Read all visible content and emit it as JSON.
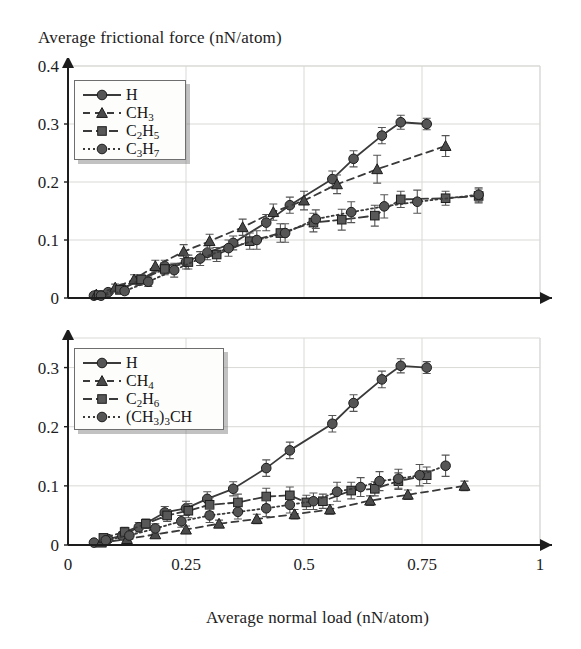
{
  "figure": {
    "y_axis_title": "Average frictional force (nN/atom)",
    "x_axis_title": "Average normal load (nN/atom)"
  },
  "chart_data": [
    {
      "id": "top",
      "type": "line",
      "title": "",
      "xlabel": "Average normal load (nN/atom)",
      "ylabel": "Average frictional force (nN/atom)",
      "xlim": [
        0,
        1
      ],
      "ylim": [
        0,
        0.4
      ],
      "xticks": [
        0,
        0.25,
        0.5,
        0.75,
        1
      ],
      "xticklabels": [
        "0",
        "0.25",
        "0.5",
        "0.75",
        "1"
      ],
      "yticks": [
        0,
        0.1,
        0.2,
        0.3,
        0.4
      ],
      "yticklabels": [
        "0",
        "0.1",
        "0.2",
        "0.3",
        "0.4"
      ],
      "grid": true,
      "legend_position": "upper-left",
      "series": [
        {
          "name": "H",
          "marker": "circle",
          "linestyle": "solid",
          "color": "#3a3a3a",
          "points": [
            {
              "x": 0.055,
              "y": 0.004,
              "err": 0.004
            },
            {
              "x": 0.085,
              "y": 0.01,
              "err": 0.005
            },
            {
              "x": 0.115,
              "y": 0.016,
              "err": 0.006
            },
            {
              "x": 0.15,
              "y": 0.03,
              "err": 0.008
            },
            {
              "x": 0.205,
              "y": 0.055,
              "err": 0.01
            },
            {
              "x": 0.25,
              "y": 0.062,
              "err": 0.012
            },
            {
              "x": 0.295,
              "y": 0.078,
              "err": 0.012
            },
            {
              "x": 0.35,
              "y": 0.095,
              "err": 0.012
            },
            {
              "x": 0.42,
              "y": 0.13,
              "err": 0.014
            },
            {
              "x": 0.47,
              "y": 0.16,
              "err": 0.014
            },
            {
              "x": 0.56,
              "y": 0.205,
              "err": 0.014
            },
            {
              "x": 0.605,
              "y": 0.24,
              "err": 0.014
            },
            {
              "x": 0.665,
              "y": 0.28,
              "err": 0.014
            },
            {
              "x": 0.705,
              "y": 0.303,
              "err": 0.012
            },
            {
              "x": 0.76,
              "y": 0.3,
              "err": 0.01
            }
          ]
        },
        {
          "name": "CH3",
          "name_html": "CH<sub>3</sub>",
          "marker": "triangle",
          "linestyle": "dashed",
          "color": "#3a3a3a",
          "points": [
            {
              "x": 0.06,
              "y": 0.006,
              "err": 0.004
            },
            {
              "x": 0.1,
              "y": 0.018,
              "err": 0.006
            },
            {
              "x": 0.14,
              "y": 0.032,
              "err": 0.008
            },
            {
              "x": 0.185,
              "y": 0.055,
              "err": 0.01
            },
            {
              "x": 0.245,
              "y": 0.08,
              "err": 0.012
            },
            {
              "x": 0.3,
              "y": 0.098,
              "err": 0.012
            },
            {
              "x": 0.37,
              "y": 0.122,
              "err": 0.014
            },
            {
              "x": 0.435,
              "y": 0.148,
              "err": 0.014
            },
            {
              "x": 0.5,
              "y": 0.168,
              "err": 0.016
            },
            {
              "x": 0.57,
              "y": 0.196,
              "err": 0.016
            },
            {
              "x": 0.655,
              "y": 0.222,
              "err": 0.024
            },
            {
              "x": 0.8,
              "y": 0.262,
              "err": 0.018
            }
          ]
        },
        {
          "name": "C2H5",
          "name_html": "C<sub>2</sub>H<sub>5</sub>",
          "marker": "square",
          "linestyle": "dashdot",
          "color": "#3a3a3a",
          "points": [
            {
              "x": 0.065,
              "y": 0.005,
              "err": 0.004
            },
            {
              "x": 0.11,
              "y": 0.014,
              "err": 0.006
            },
            {
              "x": 0.155,
              "y": 0.032,
              "err": 0.008
            },
            {
              "x": 0.205,
              "y": 0.05,
              "err": 0.01
            },
            {
              "x": 0.255,
              "y": 0.062,
              "err": 0.012
            },
            {
              "x": 0.315,
              "y": 0.075,
              "err": 0.012
            },
            {
              "x": 0.385,
              "y": 0.098,
              "err": 0.014
            },
            {
              "x": 0.45,
              "y": 0.112,
              "err": 0.016
            },
            {
              "x": 0.52,
              "y": 0.13,
              "err": 0.016
            },
            {
              "x": 0.58,
              "y": 0.135,
              "err": 0.018
            },
            {
              "x": 0.65,
              "y": 0.142,
              "err": 0.018
            },
            {
              "x": 0.705,
              "y": 0.17,
              "err": 0.014
            },
            {
              "x": 0.8,
              "y": 0.172,
              "err": 0.012
            },
            {
              "x": 0.87,
              "y": 0.176,
              "err": 0.012
            }
          ]
        },
        {
          "name": "C3H7",
          "name_html": "C<sub>3</sub>H<sub>7</sub>",
          "marker": "circle",
          "linestyle": "dotted",
          "color": "#3a3a3a",
          "points": [
            {
              "x": 0.07,
              "y": 0.004,
              "err": 0.004
            },
            {
              "x": 0.12,
              "y": 0.012,
              "err": 0.006
            },
            {
              "x": 0.17,
              "y": 0.028,
              "err": 0.008
            },
            {
              "x": 0.225,
              "y": 0.048,
              "err": 0.012
            },
            {
              "x": 0.28,
              "y": 0.068,
              "err": 0.012
            },
            {
              "x": 0.34,
              "y": 0.086,
              "err": 0.014
            },
            {
              "x": 0.4,
              "y": 0.1,
              "err": 0.016
            },
            {
              "x": 0.46,
              "y": 0.112,
              "err": 0.016
            },
            {
              "x": 0.525,
              "y": 0.136,
              "err": 0.016
            },
            {
              "x": 0.6,
              "y": 0.148,
              "err": 0.018
            },
            {
              "x": 0.67,
              "y": 0.158,
              "err": 0.02
            },
            {
              "x": 0.74,
              "y": 0.166,
              "err": 0.02
            },
            {
              "x": 0.87,
              "y": 0.178,
              "err": 0.012
            }
          ]
        }
      ]
    },
    {
      "id": "bottom",
      "type": "line",
      "title": "",
      "xlabel": "Average normal load (nN/atom)",
      "ylabel": "Average frictional force (nN/atom)",
      "xlim": [
        0,
        1
      ],
      "ylim": [
        0,
        0.35
      ],
      "xticks": [
        0,
        0.25,
        0.5,
        0.75,
        1
      ],
      "xticklabels": [
        "0",
        "0.25",
        "0.5",
        "0.75",
        "1"
      ],
      "yticks": [
        0,
        0.1,
        0.2,
        0.3
      ],
      "yticklabels": [
        "0",
        "0.1",
        "0.2",
        "0.3"
      ],
      "grid": true,
      "legend_position": "upper-left",
      "series": [
        {
          "name": "H",
          "marker": "circle",
          "linestyle": "solid",
          "color": "#3a3a3a",
          "points": [
            {
              "x": 0.055,
              "y": 0.004,
              "err": 0.004
            },
            {
              "x": 0.085,
              "y": 0.01,
              "err": 0.005
            },
            {
              "x": 0.115,
              "y": 0.016,
              "err": 0.006
            },
            {
              "x": 0.15,
              "y": 0.03,
              "err": 0.008
            },
            {
              "x": 0.205,
              "y": 0.055,
              "err": 0.01
            },
            {
              "x": 0.25,
              "y": 0.062,
              "err": 0.012
            },
            {
              "x": 0.295,
              "y": 0.078,
              "err": 0.012
            },
            {
              "x": 0.35,
              "y": 0.095,
              "err": 0.012
            },
            {
              "x": 0.42,
              "y": 0.13,
              "err": 0.014
            },
            {
              "x": 0.47,
              "y": 0.16,
              "err": 0.014
            },
            {
              "x": 0.56,
              "y": 0.205,
              "err": 0.014
            },
            {
              "x": 0.605,
              "y": 0.24,
              "err": 0.014
            },
            {
              "x": 0.665,
              "y": 0.28,
              "err": 0.014
            },
            {
              "x": 0.705,
              "y": 0.303,
              "err": 0.012
            },
            {
              "x": 0.76,
              "y": 0.3,
              "err": 0.01
            }
          ]
        },
        {
          "name": "CH4",
          "name_html": "CH<sub>4</sub>",
          "marker": "triangle",
          "linestyle": "dashed",
          "color": "#3a3a3a",
          "points": [
            {
              "x": 0.07,
              "y": 0.004,
              "err": 0.004
            },
            {
              "x": 0.125,
              "y": 0.01,
              "err": 0.005
            },
            {
              "x": 0.185,
              "y": 0.018,
              "err": 0.006
            },
            {
              "x": 0.25,
              "y": 0.026,
              "err": 0.006
            },
            {
              "x": 0.32,
              "y": 0.036,
              "err": 0.006
            },
            {
              "x": 0.4,
              "y": 0.044,
              "err": 0.008
            },
            {
              "x": 0.48,
              "y": 0.052,
              "err": 0.008
            },
            {
              "x": 0.555,
              "y": 0.06,
              "err": 0.008
            },
            {
              "x": 0.64,
              "y": 0.075,
              "err": 0.008
            },
            {
              "x": 0.72,
              "y": 0.085,
              "err": 0.008
            },
            {
              "x": 0.84,
              "y": 0.1,
              "err": 0.008
            }
          ]
        },
        {
          "name": "C2H6",
          "name_html": "C<sub>2</sub>H<sub>6</sub>",
          "marker": "square",
          "linestyle": "dashdot",
          "color": "#3a3a3a",
          "points": [
            {
              "x": 0.075,
              "y": 0.012,
              "err": 0.006
            },
            {
              "x": 0.12,
              "y": 0.022,
              "err": 0.008
            },
            {
              "x": 0.165,
              "y": 0.036,
              "err": 0.008
            },
            {
              "x": 0.21,
              "y": 0.05,
              "err": 0.01
            },
            {
              "x": 0.255,
              "y": 0.058,
              "err": 0.012
            },
            {
              "x": 0.3,
              "y": 0.068,
              "err": 0.012
            },
            {
              "x": 0.36,
              "y": 0.072,
              "err": 0.014
            },
            {
              "x": 0.42,
              "y": 0.082,
              "err": 0.014
            },
            {
              "x": 0.47,
              "y": 0.084,
              "err": 0.014
            },
            {
              "x": 0.505,
              "y": 0.072,
              "err": 0.012
            },
            {
              "x": 0.54,
              "y": 0.074,
              "err": 0.012
            },
            {
              "x": 0.6,
              "y": 0.092,
              "err": 0.014
            },
            {
              "x": 0.65,
              "y": 0.095,
              "err": 0.012
            },
            {
              "x": 0.7,
              "y": 0.108,
              "err": 0.014
            },
            {
              "x": 0.76,
              "y": 0.118,
              "err": 0.014
            }
          ]
        },
        {
          "name": "(CH3)3CH",
          "name_html": "(CH<sub>3</sub>)<sub>3</sub>CH",
          "marker": "circle",
          "linestyle": "dotted",
          "color": "#3a3a3a",
          "points": [
            {
              "x": 0.08,
              "y": 0.008,
              "err": 0.005
            },
            {
              "x": 0.13,
              "y": 0.016,
              "err": 0.006
            },
            {
              "x": 0.185,
              "y": 0.028,
              "err": 0.008
            },
            {
              "x": 0.24,
              "y": 0.04,
              "err": 0.01
            },
            {
              "x": 0.3,
              "y": 0.05,
              "err": 0.012
            },
            {
              "x": 0.36,
              "y": 0.056,
              "err": 0.012
            },
            {
              "x": 0.42,
              "y": 0.062,
              "err": 0.014
            },
            {
              "x": 0.47,
              "y": 0.068,
              "err": 0.014
            },
            {
              "x": 0.52,
              "y": 0.074,
              "err": 0.014
            },
            {
              "x": 0.57,
              "y": 0.09,
              "err": 0.016
            },
            {
              "x": 0.62,
              "y": 0.098,
              "err": 0.016
            },
            {
              "x": 0.66,
              "y": 0.108,
              "err": 0.016
            },
            {
              "x": 0.7,
              "y": 0.112,
              "err": 0.016
            },
            {
              "x": 0.745,
              "y": 0.118,
              "err": 0.018
            },
            {
              "x": 0.8,
              "y": 0.134,
              "err": 0.018
            }
          ]
        }
      ]
    }
  ],
  "legends": {
    "top": [
      {
        "label": "H",
        "marker": "circle",
        "linestyle": "solid"
      },
      {
        "label": "CH3",
        "marker": "triangle",
        "linestyle": "dashed"
      },
      {
        "label": "C2H5",
        "marker": "square",
        "linestyle": "dashdot"
      },
      {
        "label": "C3H7",
        "marker": "circle",
        "linestyle": "dotted"
      }
    ],
    "bottom": [
      {
        "label": "H",
        "marker": "circle",
        "linestyle": "solid"
      },
      {
        "label": "CH4",
        "marker": "triangle",
        "linestyle": "dashed"
      },
      {
        "label": "C2H6",
        "marker": "square",
        "linestyle": "dashdot"
      },
      {
        "label": "(CH3)3CH",
        "marker": "circle",
        "linestyle": "dotted"
      }
    ]
  }
}
